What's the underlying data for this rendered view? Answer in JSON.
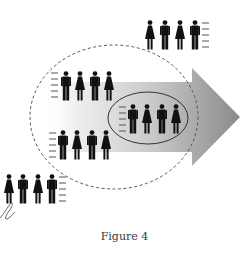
{
  "figure": {
    "caption": "Figure 4",
    "colors": {
      "arrow_light": "#f4f4f4",
      "arrow_dark": "#8c8c8c",
      "figure_fill": "#111111",
      "dashed_circle": "#555555",
      "ellipse": "#333333",
      "caption": "#3a3a3a"
    },
    "groups": [
      {
        "id": "top-right",
        "members": [
          "female",
          "male",
          "female",
          "male"
        ],
        "speed_lines": "right"
      },
      {
        "id": "upper-left-in-circle",
        "members": [
          "male",
          "female",
          "male",
          "female"
        ],
        "speed_lines": "left"
      },
      {
        "id": "inside-ellipse",
        "members": [
          "male",
          "female",
          "male",
          "female"
        ],
        "speed_lines": "left"
      },
      {
        "id": "lower-left-in-circle",
        "members": [
          "male",
          "female",
          "male",
          "female"
        ],
        "speed_lines": "left"
      },
      {
        "id": "bottom-left-outside",
        "members": [
          "female",
          "male",
          "female",
          "male"
        ],
        "speed_lines": "right"
      }
    ]
  }
}
